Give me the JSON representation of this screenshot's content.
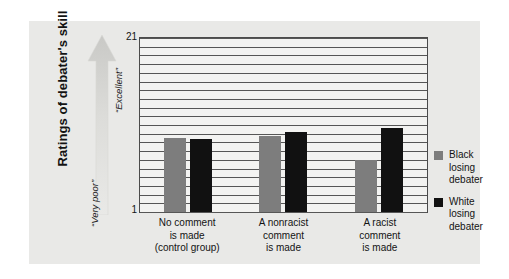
{
  "chart_data": {
    "type": "bar",
    "title": "",
    "subtitle": "",
    "xlabel": "",
    "ylabel": "Ratings of debater's skill",
    "ylim": [
      1,
      21
    ],
    "ytick_labels": [
      "21",
      "1"
    ],
    "gridlines": 20,
    "grid": true,
    "legend_position": "right",
    "scale_anchor_high": "“Excellent”",
    "scale_anchor_low": "“Very poor”",
    "categories": [
      "No comment\nis made\n(control group)",
      "A nonracist\ncomment\nis made",
      "A racist\ncomment\nis made"
    ],
    "category_lines": [
      [
        "No comment",
        "is made",
        "(control group)"
      ],
      [
        "A nonracist",
        "comment",
        "is made"
      ],
      [
        "A racist",
        "comment",
        "is made"
      ]
    ],
    "series": [
      {
        "name": "Black losing debater",
        "name_lines": [
          "Black",
          "losing",
          "debater"
        ],
        "color": "#7d7d7d",
        "values": [
          9.5,
          9.7,
          7.0
        ]
      },
      {
        "name": "White losing debater",
        "name_lines": [
          "White",
          "losing",
          "debater"
        ],
        "color": "#111111",
        "values": [
          9.4,
          10.2,
          10.6
        ]
      }
    ]
  },
  "colors": {
    "figure_background": "#e9e9e7",
    "plot_background": "#f3f3f1",
    "gridline": "#565656",
    "axis": "#4b4b4b",
    "arrow": "#d2d2cf",
    "text": "#131313"
  }
}
